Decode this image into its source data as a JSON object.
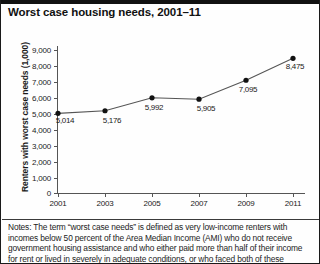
{
  "title": "Worst case housing needs, 2001–11",
  "chart_data": {
    "type": "line",
    "title": "Worst case housing needs, 2001–11",
    "xlabel": "",
    "ylabel": "Renters with worst case needs (1,000)",
    "categories": [
      "2001",
      "2003",
      "2005",
      "2007",
      "2009",
      "2011"
    ],
    "x": [
      2001,
      2003,
      2005,
      2007,
      2009,
      2011
    ],
    "values": [
      5014,
      5176,
      5992,
      5905,
      7095,
      8475
    ],
    "point_labels": [
      "5,014",
      "5,176",
      "5,992",
      "5,905",
      "7,095",
      "8,475"
    ],
    "ylim": [
      0,
      9000
    ],
    "yticks": [
      0,
      1000,
      2000,
      3000,
      4000,
      5000,
      6000,
      7000,
      8000,
      9000
    ],
    "ytick_labels": [
      "0",
      "1,000",
      "2,000",
      "3,000",
      "4,000",
      "5,000",
      "6,000",
      "7,000",
      "8,000",
      "9,000"
    ],
    "grid": false,
    "legend": false,
    "marker": "filled-circle",
    "line_color": "#555555",
    "marker_color": "#111111"
  },
  "axis": {
    "y_label": "Renters with worst case needs (1,000)",
    "y_ticks": [
      "9,000",
      "8,000",
      "7,000",
      "6,000",
      "5,000",
      "4,000",
      "3,000",
      "2,000",
      "1,000",
      "0"
    ],
    "x_ticks": [
      "2001",
      "2003",
      "2005",
      "2007",
      "2009",
      "2011"
    ]
  },
  "notes": {
    "lines": [
      "Notes: The term “worst case needs” is defined as very low-income renters with",
      "incomes below 50 percent of the Area Median Income (AMI) who do not receive",
      "government housing assistance and who either paid more than half of their income",
      "for rent or lived in severely in adequate conditions, or who faced both of these"
    ]
  },
  "colors": {
    "rule": "#111111",
    "axis": "#555555",
    "text": "#1a1a1a"
  }
}
